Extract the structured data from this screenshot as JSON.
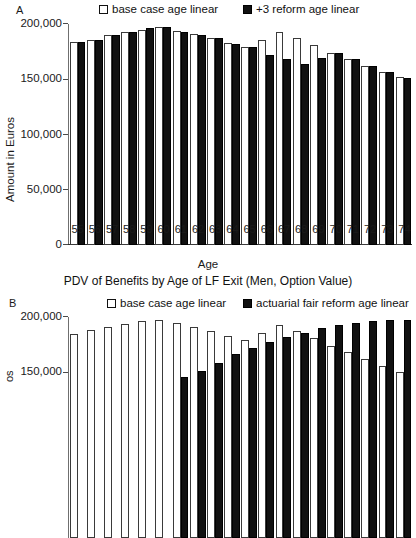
{
  "figure": {
    "caption_a": "PDV of Benefits by Age of LF Exit (Men, Option Value)"
  },
  "panelA": {
    "letter": "A",
    "ylabel": "Amount in Euros",
    "xlabel": "Age",
    "legend": [
      {
        "label": "base case age linear",
        "style": "open"
      },
      {
        "label": "+3 reform age linear",
        "style": "fill"
      }
    ],
    "yticks": [
      "0",
      "50,000",
      "100,000",
      "150,000",
      "200,000"
    ]
  },
  "panelB": {
    "letter": "B",
    "ylabel": "os",
    "legend": [
      {
        "label": "base case age linear",
        "style": "open"
      },
      {
        "label": "actuarial fair reform age linear",
        "style": "fill"
      }
    ],
    "yticks": [
      "150,000",
      "200,000"
    ]
  },
  "chart_data": [
    {
      "type": "bar",
      "panel": "A",
      "title": "PDV of Benefits by Age of LF Exit (Men, Option Value)",
      "xlabel": "Age",
      "ylabel": "Amount in Euros",
      "ylim": [
        0,
        200000
      ],
      "yticks": [
        0,
        50000,
        100000,
        150000,
        200000
      ],
      "grid": false,
      "legend_position": "top",
      "categories": [
        55,
        56,
        57,
        58,
        59,
        60,
        61,
        62,
        63,
        64,
        65,
        66,
        67,
        68,
        69,
        70,
        71,
        72,
        73,
        74
      ],
      "series": [
        {
          "name": "base case age linear",
          "style": "open",
          "values": [
            184000,
            186000,
            190000,
            193000,
            195000,
            197000,
            194000,
            191000,
            187000,
            183000,
            179000,
            186000,
            193000,
            187000,
            181000,
            174000,
            168000,
            162000,
            157000,
            152000
          ]
        },
        {
          "name": "+3 reform age linear",
          "style": "fill",
          "values": [
            184000,
            186000,
            190000,
            193000,
            196000,
            197000,
            193000,
            190000,
            187000,
            182000,
            179000,
            172000,
            168000,
            164000,
            169000,
            174000,
            168000,
            162000,
            157000,
            151000
          ]
        }
      ]
    },
    {
      "type": "bar",
      "panel": "B",
      "xlabel": "Age",
      "ylabel": "Amount in Euros",
      "ylim": [
        0,
        200000
      ],
      "yticks": [
        150000,
        200000
      ],
      "grid": false,
      "legend_position": "top",
      "categories": [
        55,
        56,
        57,
        58,
        59,
        60,
        61,
        62,
        63,
        64,
        65,
        66,
        67,
        68,
        69,
        70,
        71,
        72,
        73,
        74
      ],
      "series": [
        {
          "name": "base case age linear",
          "style": "open",
          "values": [
            185000,
            188000,
            191000,
            194000,
            196000,
            197000,
            195000,
            191000,
            187000,
            183000,
            179000,
            186000,
            193000,
            187000,
            181000,
            174000,
            168000,
            162000,
            156000,
            150000
          ]
        },
        {
          "name": "actuarial fair reform age linear",
          "style": "fill",
          "values": [
            null,
            null,
            null,
            null,
            null,
            null,
            146000,
            151000,
            158000,
            167000,
            172000,
            177000,
            182000,
            186000,
            190000,
            193000,
            195000,
            196000,
            197000,
            197000
          ]
        }
      ]
    }
  ]
}
